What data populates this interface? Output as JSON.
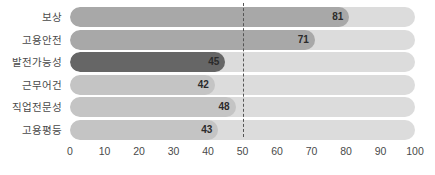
{
  "chart_data": {
    "type": "bar",
    "orientation": "horizontal",
    "title": "",
    "xlabel": "",
    "ylabel": "",
    "xlim": [
      0,
      100
    ],
    "xticks": [
      "0",
      "10",
      "20",
      "30",
      "40",
      "50",
      "60",
      "70",
      "80",
      "90",
      "100"
    ],
    "grid": false,
    "legend": null,
    "reference_line": {
      "value": 50,
      "style": "dashed",
      "color": "#555555"
    },
    "categories": [
      "보상",
      "고용안전",
      "발전가능성",
      "근무어건",
      "직업전문성",
      "고용평등"
    ],
    "values": [
      81,
      71,
      45,
      42,
      48,
      43
    ],
    "value_labels": [
      "81",
      "71",
      "45",
      "42",
      "48",
      "43"
    ],
    "bar_colors": [
      "#a8a8a8",
      "#a8a8a8",
      "#666666",
      "#c4c4c4",
      "#c4c4c4",
      "#c4c4c4"
    ],
    "track_color": "#dcdcdc",
    "background_color": "#ffffff",
    "label_color": "#4a4a4a",
    "value_text_color": "#2b2b2b",
    "bars": [
      {
        "category": "보상",
        "value": 81,
        "label": "81",
        "color": "#a8a8a8"
      },
      {
        "category": "고용안전",
        "value": 71,
        "label": "71",
        "color": "#a8a8a8"
      },
      {
        "category": "발전가능성",
        "value": 45,
        "label": "45",
        "color": "#666666"
      },
      {
        "category": "근무어건",
        "value": 42,
        "label": "42",
        "color": "#c4c4c4"
      },
      {
        "category": "직업전문성",
        "value": 48,
        "label": "48",
        "color": "#c4c4c4"
      },
      {
        "category": "고용평등",
        "value": 43,
        "label": "43",
        "color": "#c4c4c4"
      }
    ]
  }
}
